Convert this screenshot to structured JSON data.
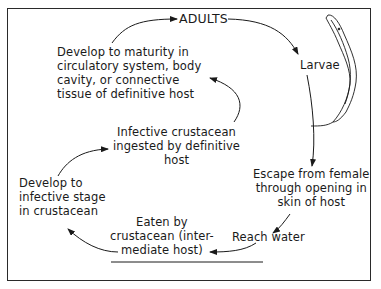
{
  "diagram": {
    "type": "life-cycle",
    "nodes": {
      "adults": "ADULTS",
      "larvae": "Larvae",
      "escape": "Escape from female\nthrough opening in\nskin of host",
      "reach_water": "Reach water",
      "eaten": "Eaten by\ncrustacean (inter-\nmediate host)",
      "develop_infective": "Develop to\ninfective stage\nin crustacean",
      "ingested": "Infective crustacean\ningested by definitive\nhost",
      "develop_maturity": "Develop to maturity in\ncirculatory system, body\ncavity, or connective\ntissue of definitive host"
    },
    "edges": [
      {
        "from": "adults",
        "to": "larvae"
      },
      {
        "from": "larvae",
        "to": "escape"
      },
      {
        "from": "escape",
        "to": "reach_water"
      },
      {
        "from": "reach_water",
        "to": "eaten"
      },
      {
        "from": "eaten",
        "to": "develop_infective"
      },
      {
        "from": "develop_infective",
        "to": "ingested"
      },
      {
        "from": "ingested",
        "to": "develop_maturity"
      },
      {
        "from": "develop_maturity",
        "to": "adults"
      }
    ],
    "illustration": "larva-worm"
  }
}
